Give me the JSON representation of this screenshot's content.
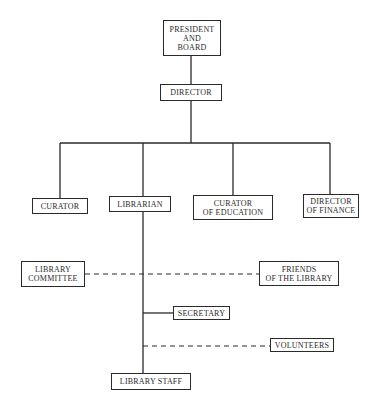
{
  "diagram": {
    "type": "organizational-chart",
    "line_color": "#2a2a2a",
    "background": "#ffffff",
    "nodes": {
      "president": {
        "lines": [
          "PRESIDENT",
          "AND",
          "BOARD"
        ]
      },
      "director": {
        "lines": [
          "DIRECTOR"
        ]
      },
      "curator": {
        "lines": [
          "CURATOR"
        ]
      },
      "librarian": {
        "lines": [
          "LIBRARIAN"
        ]
      },
      "curator_education": {
        "lines": [
          "CURATOR",
          "OF EDUCATION"
        ]
      },
      "director_finance": {
        "lines": [
          "DIRECTOR",
          "OF FINANCE"
        ]
      },
      "library_committee": {
        "lines": [
          "LIBRARY",
          "COMMITTEE"
        ]
      },
      "friends_library": {
        "lines": [
          "FRIENDS",
          "OF THE LIBRARY"
        ]
      },
      "secretary": {
        "lines": [
          "SECRETARY"
        ]
      },
      "volunteers": {
        "lines": [
          "VOLUNTEERS"
        ]
      },
      "library_staff": {
        "lines": [
          "LIBRARY STAFF"
        ]
      }
    },
    "edges": [
      {
        "from": "president",
        "to": "director",
        "style": "solid"
      },
      {
        "from": "director",
        "to": "curator",
        "style": "solid"
      },
      {
        "from": "director",
        "to": "librarian",
        "style": "solid"
      },
      {
        "from": "director",
        "to": "curator_education",
        "style": "solid"
      },
      {
        "from": "director",
        "to": "director_finance",
        "style": "solid"
      },
      {
        "from": "librarian",
        "to": "secretary",
        "style": "solid"
      },
      {
        "from": "librarian",
        "to": "library_staff",
        "style": "solid"
      },
      {
        "from": "library_committee",
        "to": "friends_library",
        "style": "dashed",
        "via": "librarian-line"
      },
      {
        "from": "librarian",
        "to": "volunteers",
        "style": "dashed"
      }
    ]
  }
}
